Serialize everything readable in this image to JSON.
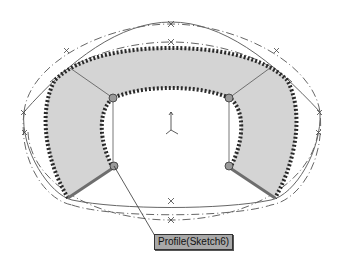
{
  "viewport": {
    "background": "#ffffff",
    "colors": {
      "surface_fill": "#d4d4d4",
      "edge_hatch": "#2a2a2a",
      "guide_curve": "#555555",
      "construction_line": "#666666",
      "profile_edge": "#777777",
      "node_fill": "#9a9a9a"
    }
  },
  "callout": {
    "label": "Profile(Sketch6)",
    "icon": "leader-line"
  },
  "origin_triad": {
    "icon": "coordinate-axes-icon"
  },
  "feature": {
    "type": "loft-preview",
    "guide_curve_count": 4,
    "profile_count": 2
  }
}
